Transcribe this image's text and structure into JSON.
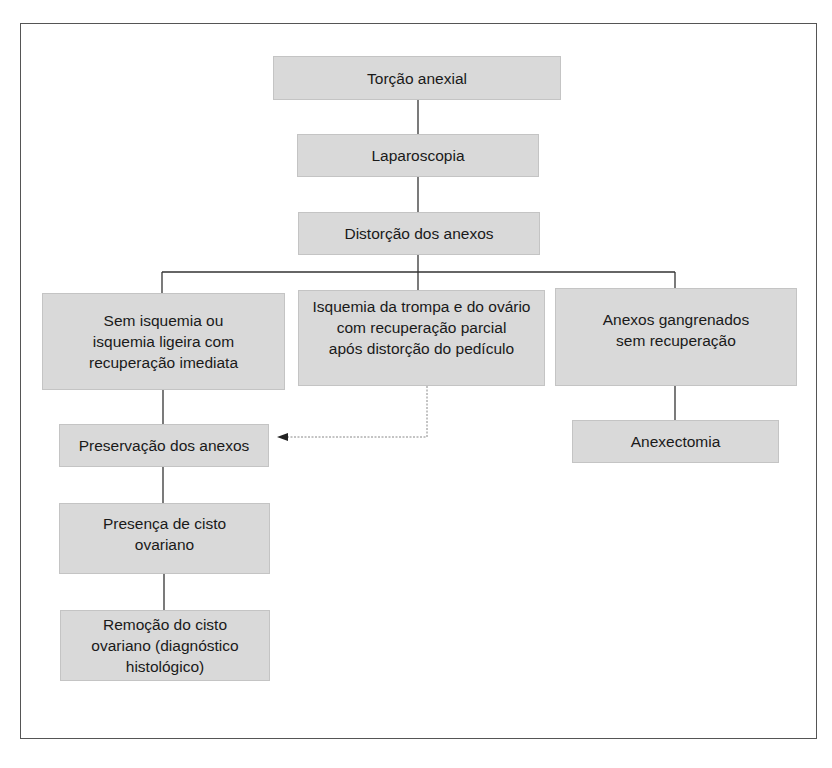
{
  "diagram": {
    "type": "flowchart",
    "nodes": {
      "torcao": "Torção anexial",
      "laparoscopia": "Laparoscopia",
      "distorcao": "Distorção dos anexos",
      "sem_isquemia": "Sem isquemia ou\nisquemia ligeira com\nrecuperação imediata",
      "isquemia_parcial": "Isquemia da trompa e do ovário\ncom recuperação parcial\napós distorção do pedículo",
      "gangrenados": "Anexos gangrenados\nsem recuperação",
      "preservacao": "Preservação dos anexos",
      "anexectomia": "Anexectomia",
      "cisto": "Presença de cisto\novariano",
      "remocao": "Remoção do cisto\novariano (diagnóstico\nhistológico)"
    },
    "edges": [
      {
        "from": "torcao",
        "to": "laparoscopia",
        "style": "solid"
      },
      {
        "from": "laparoscopia",
        "to": "distorcao",
        "style": "solid"
      },
      {
        "from": "distorcao",
        "to": "sem_isquemia",
        "style": "solid"
      },
      {
        "from": "distorcao",
        "to": "isquemia_parcial",
        "style": "solid"
      },
      {
        "from": "distorcao",
        "to": "gangrenados",
        "style": "solid"
      },
      {
        "from": "sem_isquemia",
        "to": "preservacao",
        "style": "solid"
      },
      {
        "from": "isquemia_parcial",
        "to": "preservacao",
        "style": "dotted-arrow"
      },
      {
        "from": "gangrenados",
        "to": "anexectomia",
        "style": "solid"
      },
      {
        "from": "preservacao",
        "to": "cisto",
        "style": "solid"
      },
      {
        "from": "cisto",
        "to": "remocao",
        "style": "solid"
      }
    ],
    "colors": {
      "box_fill": "#d9d9d9",
      "line": "#333333",
      "dotted_line": "#888888"
    }
  }
}
